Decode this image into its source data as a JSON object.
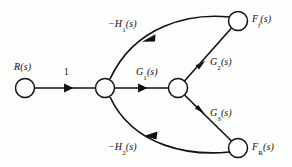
{
  "figure": {
    "type": "signal-flow-graph",
    "background_color": "#fdfdfb",
    "line_color": "#111111",
    "node_fill": "#ffffff"
  },
  "nodes": [
    {
      "id": "R",
      "label_main": "R",
      "label_sub": "",
      "label_tail": "(s)",
      "x": 25,
      "y": 88,
      "r": 9.5
    },
    {
      "id": "n1",
      "label_main": "",
      "label_sub": "",
      "label_tail": "",
      "x": 105,
      "y": 88,
      "r": 9.5
    },
    {
      "id": "n2",
      "label_main": "",
      "label_sub": "",
      "label_tail": "",
      "x": 178,
      "y": 88,
      "r": 9.5
    },
    {
      "id": "Ff",
      "label_main": "F",
      "label_sub": "f",
      "label_tail": "(s)",
      "x": 238,
      "y": 21,
      "r": 9.5
    },
    {
      "id": "FR",
      "label_main": "F",
      "label_sub": "R",
      "label_tail": "(s)",
      "x": 238,
      "y": 148,
      "r": 9.5
    }
  ],
  "node_labels": [
    {
      "name": "node-label-R",
      "main": "R",
      "sub": "",
      "sub_italic": false,
      "tail": "(s)",
      "x": 14,
      "y": 62
    },
    {
      "name": "node-label-Ff",
      "main": "F",
      "sub": "f",
      "sub_italic": true,
      "tail": "(s)",
      "x": 252,
      "y": 14
    },
    {
      "name": "node-label-FR",
      "main": "F",
      "sub": "R",
      "sub_italic": false,
      "tail": "(s)",
      "x": 252,
      "y": 142
    }
  ],
  "edges": [
    {
      "name": "edge-input-gain",
      "from": "R",
      "to": "n1",
      "gain_main": "1",
      "gain_sub": "",
      "gain_tail": "",
      "shape": "straight",
      "direction": "right"
    },
    {
      "name": "edge-G1",
      "from": "n1",
      "to": "n2",
      "gain_main": "G",
      "gain_sub": "1",
      "gain_tail": "(s)",
      "shape": "straight",
      "direction": "right"
    },
    {
      "name": "edge-G2",
      "from": "n2",
      "to": "Ff",
      "gain_main": "G",
      "gain_sub": "2",
      "gain_tail": "(s)",
      "shape": "straight",
      "direction": "up-right"
    },
    {
      "name": "edge-G3",
      "from": "n2",
      "to": "FR",
      "gain_main": "G",
      "gain_sub": "3",
      "gain_tail": "(s)",
      "shape": "straight",
      "direction": "down-right"
    },
    {
      "name": "edge-H1-feedback",
      "from": "Ff",
      "to": "n1",
      "gain_main": "−H",
      "gain_sub": "1",
      "gain_tail": "(s)",
      "shape": "curve",
      "direction": "left-down"
    },
    {
      "name": "edge-H2-feedback",
      "from": "FR",
      "to": "n1",
      "gain_main": "−H",
      "gain_sub": "2",
      "gain_tail": "(s)",
      "shape": "curve",
      "direction": "left-up"
    }
  ],
  "edge_labels": [
    {
      "name": "edge-label-input-gain",
      "main": "1",
      "sub": "",
      "tail": "",
      "plain": true,
      "x": 64,
      "y": 68
    },
    {
      "name": "edge-label-G1",
      "main": "G",
      "sub": "1",
      "tail": "(s)",
      "plain": false,
      "x": 136,
      "y": 67
    },
    {
      "name": "edge-label-G2",
      "main": "G",
      "sub": "2",
      "tail": "(s)",
      "plain": false,
      "x": 210,
      "y": 57
    },
    {
      "name": "edge-label-G3",
      "main": "G",
      "sub": "3",
      "tail": "(s)",
      "plain": false,
      "x": 210,
      "y": 108
    },
    {
      "name": "edge-label-H1",
      "main": "−H",
      "sub": "1",
      "tail": "(s)",
      "plain": false,
      "x": 108,
      "y": 19
    },
    {
      "name": "edge-label-H2",
      "main": "−H",
      "sub": "2",
      "tail": "(s)",
      "plain": false,
      "x": 108,
      "y": 142
    }
  ]
}
